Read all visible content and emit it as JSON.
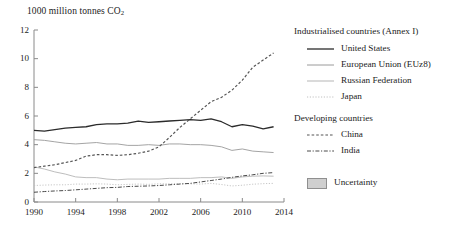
{
  "chart_data": {
    "type": "line",
    "title": "1000 million tonnes CO",
    "title_sub": "2",
    "xlabel": "",
    "ylabel": "",
    "xlim": [
      1990,
      2014
    ],
    "ylim": [
      0,
      12
    ],
    "grid": false,
    "legend_position": "right",
    "xticks": [
      "1990",
      "1994",
      "1998",
      "2002",
      "2006",
      "2010",
      "2014"
    ],
    "yticks": [
      "0",
      "2",
      "4",
      "6",
      "8",
      "10",
      "12"
    ],
    "x": [
      1990,
      1991,
      1992,
      1993,
      1994,
      1995,
      1996,
      1997,
      1998,
      1999,
      2000,
      2001,
      2002,
      2003,
      2004,
      2005,
      2006,
      2007,
      2008,
      2009,
      2010,
      2011,
      2012,
      2013
    ],
    "series": [
      {
        "name": "United States",
        "style": "solid",
        "color": "#2b2b2b",
        "values": [
          5.0,
          4.95,
          5.05,
          5.15,
          5.2,
          5.25,
          5.4,
          5.45,
          5.45,
          5.5,
          5.65,
          5.55,
          5.6,
          5.65,
          5.7,
          5.75,
          5.7,
          5.8,
          5.6,
          5.25,
          5.4,
          5.3,
          5.1,
          5.25
        ]
      },
      {
        "name": "European Union (EUz8)",
        "style": "solid-thin",
        "color": "#9a9a9a",
        "values": [
          4.35,
          4.3,
          4.2,
          4.1,
          4.05,
          4.1,
          4.15,
          4.05,
          4.05,
          3.95,
          3.95,
          4.0,
          3.95,
          4.05,
          4.05,
          4.0,
          4.0,
          3.95,
          3.85,
          3.6,
          3.7,
          3.55,
          3.5,
          3.45
        ]
      },
      {
        "name": "Russian Federation",
        "style": "solid-light",
        "color": "#b5b5b5",
        "values": [
          2.45,
          2.3,
          2.1,
          1.95,
          1.75,
          1.7,
          1.7,
          1.6,
          1.55,
          1.6,
          1.6,
          1.6,
          1.6,
          1.65,
          1.65,
          1.65,
          1.7,
          1.7,
          1.75,
          1.65,
          1.75,
          1.8,
          1.82,
          1.8
        ]
      },
      {
        "name": "Japan",
        "style": "dotted-light",
        "color": "#c0c0c0",
        "values": [
          1.15,
          1.18,
          1.2,
          1.2,
          1.25,
          1.25,
          1.27,
          1.25,
          1.2,
          1.23,
          1.25,
          1.23,
          1.27,
          1.27,
          1.28,
          1.27,
          1.25,
          1.3,
          1.22,
          1.12,
          1.17,
          1.24,
          1.28,
          1.3
        ]
      },
      {
        "name": "China",
        "style": "dashed",
        "color": "#555555",
        "values": [
          2.4,
          2.5,
          2.6,
          2.75,
          2.9,
          3.2,
          3.3,
          3.3,
          3.25,
          3.3,
          3.4,
          3.55,
          3.85,
          4.5,
          5.2,
          5.8,
          6.4,
          7.0,
          7.3,
          7.8,
          8.5,
          9.4,
          9.9,
          10.4
        ]
      },
      {
        "name": "India",
        "style": "dash-dot",
        "color": "#4a4a4a",
        "values": [
          0.68,
          0.73,
          0.77,
          0.8,
          0.85,
          0.9,
          0.95,
          1.0,
          1.02,
          1.08,
          1.1,
          1.12,
          1.15,
          1.2,
          1.25,
          1.3,
          1.4,
          1.5,
          1.6,
          1.72,
          1.82,
          1.9,
          2.0,
          2.05
        ]
      }
    ],
    "annotations": []
  },
  "legend": {
    "group1_title": "Industrialised countries (Annex I)",
    "group2_title": "Developing countries",
    "items_group1": [
      {
        "label": "United States"
      },
      {
        "label": "European Union (EUz8)"
      },
      {
        "label": "Russian Federation"
      },
      {
        "label": "Japan"
      }
    ],
    "items_group2": [
      {
        "label": "China"
      },
      {
        "label": "India"
      }
    ],
    "uncertainty_label": "Uncertainty",
    "uncertainty_fill": "#cfcfcf",
    "uncertainty_border": "#8f8f8f"
  },
  "axis": {
    "color": "#8a8a8a"
  }
}
